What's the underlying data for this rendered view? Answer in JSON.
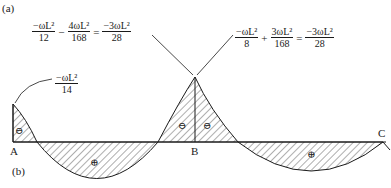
{
  "figure": {
    "part_a_label": "(a)",
    "part_b_label": "(b)"
  },
  "equations": {
    "left": {
      "term1": {
        "num": "−ωL²",
        "den": "12"
      },
      "op1": "−",
      "term2": {
        "num": "4ωL²",
        "den": "168"
      },
      "op2": "=",
      "result": {
        "num": "−3ωL²",
        "den": "28"
      }
    },
    "right": {
      "term1": {
        "num": "−ωL²",
        "den": "8"
      },
      "op1": "+",
      "term2": {
        "num": "3ωL²",
        "den": "168"
      },
      "op2": "=",
      "result": {
        "num": "−3ωL²",
        "den": "28"
      }
    },
    "end_moment": {
      "num": "−ωL²",
      "den": "14"
    }
  },
  "supports": {
    "a": "A",
    "b": "B",
    "c": "C"
  },
  "sign_markers": {
    "negative": "⊖",
    "positive": "⊕"
  },
  "colors": {
    "line": "#1a1a1a",
    "hatch": "#333333",
    "background": "#ffffff"
  }
}
